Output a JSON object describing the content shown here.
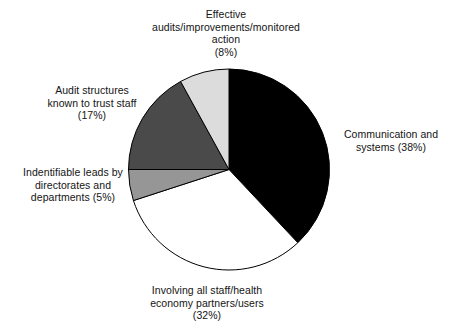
{
  "chart_data": {
    "type": "pie",
    "title": "",
    "subtitle": "",
    "xlabel": "",
    "ylabel": "",
    "legend_position": "none",
    "grid": false,
    "start_angle_deg": 0,
    "direction": "clockwise",
    "categories": [
      "Communication and systems",
      "Involving all staff/health economy partners/users",
      "Indentifiable leads by directorates and departments",
      "Audit structures known to trust staff",
      "Effective audits/improvements/monitored action"
    ],
    "values": [
      38,
      32,
      5,
      17,
      8
    ],
    "units": "percent",
    "slices": [
      {
        "name": "Communication and systems",
        "value": 38,
        "percent_text": "(38%)",
        "color": "#000000",
        "start_deg": 0,
        "end_deg": 136.8
      },
      {
        "name": "Involving all staff/health economy partners/users",
        "value": 32,
        "percent_text": "(32%)",
        "color": "#ffffff",
        "start_deg": 136.8,
        "end_deg": 252.0
      },
      {
        "name": "Indentifiable leads by directorates and departments",
        "value": 5,
        "percent_text": "(5%)",
        "color": "#969696",
        "start_deg": 252.0,
        "end_deg": 270.0
      },
      {
        "name": "Audit structures known to trust staff",
        "value": 17,
        "percent_text": "(17%)",
        "color": "#4a4a4a",
        "start_deg": 270.0,
        "end_deg": 331.2
      },
      {
        "name": "Effective audits/improvements/monitored action",
        "value": 8,
        "percent_text": "(8%)",
        "color": "#dcdcdc",
        "start_deg": 331.2,
        "end_deg": 360.0
      }
    ]
  },
  "labels": {
    "effective": "Effective\naudits/improvements/monitored\naction\n(8%)",
    "communication": "Communication and\nsystems (38%)",
    "audit_structures": "Audit structures\nknown to trust staff\n(17%)",
    "indentifiable": "Indentifiable leads by\ndirectorates and\ndepartments (5%)",
    "involving": "Involving all staff/health\neconomy partners/users\n(32%)"
  },
  "style": {
    "background": "#ffffff",
    "outline": "#000000",
    "text_color": "#141414"
  }
}
